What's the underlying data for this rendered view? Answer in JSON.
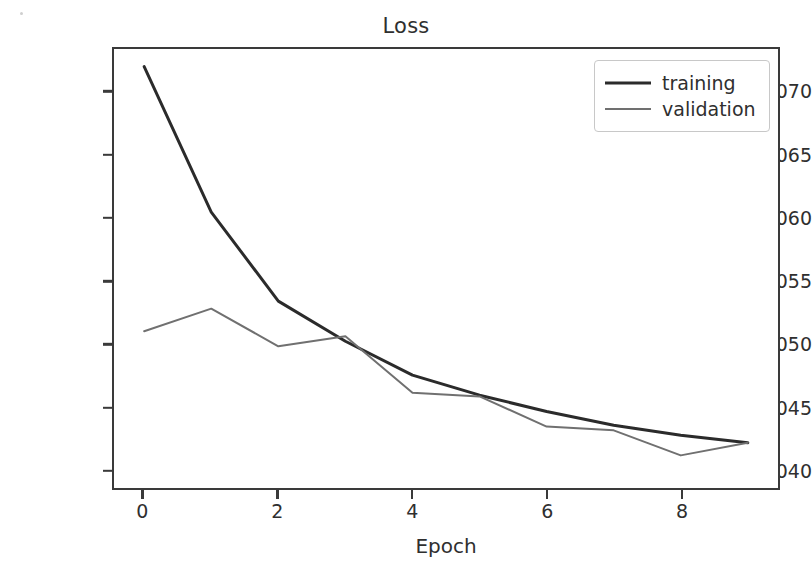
{
  "chart_data": {
    "type": "line",
    "title": "Loss",
    "xlabel": "Epoch",
    "ylabel": "",
    "x": [
      0,
      1,
      2,
      3,
      4,
      5,
      6,
      7,
      8,
      9
    ],
    "xlim": [
      -0.45,
      9.45
    ],
    "ylim": [
      0.0385,
      0.0735
    ],
    "grid": false,
    "legend_position": "upper right",
    "xticks": [
      0,
      2,
      4,
      6,
      8
    ],
    "xtick_labels": [
      "0",
      "2",
      "4",
      "6",
      "8"
    ],
    "yticks": [
      0.04,
      0.045,
      0.05,
      0.055,
      0.06,
      0.065,
      0.07
    ],
    "ytick_labels": [
      "0.040",
      "0.045",
      "0.050",
      "0.055",
      "0.060",
      "0.065",
      "0.070"
    ],
    "series": [
      {
        "name": "training",
        "color": "#2b2b2b",
        "width": 3.0,
        "values": [
          0.0721,
          0.0605,
          0.0534,
          0.0502,
          0.0475,
          0.0459,
          0.0446,
          0.0435,
          0.0427,
          0.0421
        ]
      },
      {
        "name": "validation",
        "color": "#707070",
        "width": 2.0,
        "values": [
          0.051,
          0.0528,
          0.0498,
          0.0506,
          0.0461,
          0.0458,
          0.0434,
          0.0431,
          0.0411,
          0.0421
        ]
      }
    ]
  },
  "legend": {
    "entries": [
      {
        "label": "training"
      },
      {
        "label": "validation"
      }
    ]
  },
  "colors": {
    "training": "#2b2b2b",
    "validation": "#707070",
    "axis": "#3a3a3a",
    "legend_border": "#c8c8c8",
    "background": "#ffffff"
  }
}
